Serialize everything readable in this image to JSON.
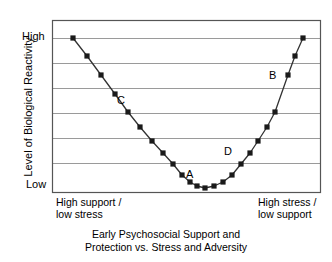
{
  "chart_data": {
    "type": "line",
    "title": "",
    "caption_line_1": "Early Psychosocial Support and",
    "caption_line_2": "Protection vs. Stress and Adversity",
    "ylabel": "Level of Biological Reactivity",
    "xlabel": "",
    "ytick_labels": [
      "High",
      "Low"
    ],
    "xtick_labels_left": [
      "High support /",
      "low stress"
    ],
    "xtick_labels_right": [
      "High stress /",
      "low support"
    ],
    "xlim": [
      0,
      100
    ],
    "ylim": [
      0,
      100
    ],
    "grid": "horizontal",
    "gridline_count": 6,
    "legend": "none",
    "marker": "square",
    "marker_color": "#1a1a1a",
    "line_color": "#333333",
    "grid_color": "#9a9a9a",
    "axis_color": "#555555",
    "series": [
      {
        "name": "Biological reactivity",
        "x": [
          7.8,
          13.1,
          18.3,
          23.5,
          28.7,
          34.0,
          39.2,
          44.4,
          49.6,
          54.9,
          60.1,
          65.3,
          70.5,
          75.8,
          81.0,
          86.2,
          91.4,
          96.7,
          100.0
        ],
        "y": [
          89.5,
          78.0,
          66.5,
          54.0,
          42.5,
          31.5,
          22.0,
          14.0,
          8.0,
          4.5,
          3.0,
          4.5,
          8.0,
          14.0,
          22.0,
          31.5,
          42.5,
          54.0,
          66.5
        ]
      }
    ],
    "points_px": [
      [
        73,
        38
      ],
      [
        87,
        56
      ],
      [
        101,
        75
      ],
      [
        115,
        94
      ],
      [
        128,
        112
      ],
      [
        140,
        127
      ],
      [
        152,
        141
      ],
      [
        163,
        153
      ],
      [
        173,
        164
      ],
      [
        182,
        175
      ],
      [
        190,
        182
      ],
      [
        197,
        186
      ],
      [
        205,
        188
      ],
      [
        214,
        186
      ],
      [
        223,
        182
      ],
      [
        232,
        175
      ],
      [
        241,
        164
      ],
      [
        250,
        153
      ],
      [
        258,
        141
      ],
      [
        267,
        127
      ],
      [
        275,
        112
      ],
      [
        288,
        75
      ],
      [
        295,
        56
      ],
      [
        303,
        38
      ]
    ],
    "annotations": [
      {
        "label": "C",
        "x_px": 117,
        "y_px": 94,
        "description": "left descending branch, moderate-high reactivity"
      },
      {
        "label": "A",
        "x_px": 186,
        "y_px": 168,
        "description": "curve minimum, lowest reactivity"
      },
      {
        "label": "D",
        "x_px": 224,
        "y_px": 145,
        "description": "right ascending branch, low-moderate reactivity"
      },
      {
        "label": "B",
        "x_px": 269,
        "y_px": 69,
        "description": "right ascending branch, high reactivity"
      }
    ]
  },
  "chart": {
    "ylabel": "Level of Biological Reactivity",
    "tick_high": "High",
    "tick_low": "Low",
    "xlab_left_1": "High support /",
    "xlab_left_2": "low stress",
    "xlab_right_1": "High stress /",
    "xlab_right_2": "low support",
    "caption_1": "Early Psychosocial Support and",
    "caption_2": "Protection vs. Stress and Adversity",
    "ann_a": "A",
    "ann_b": "B",
    "ann_c": "C",
    "ann_d": "D"
  }
}
